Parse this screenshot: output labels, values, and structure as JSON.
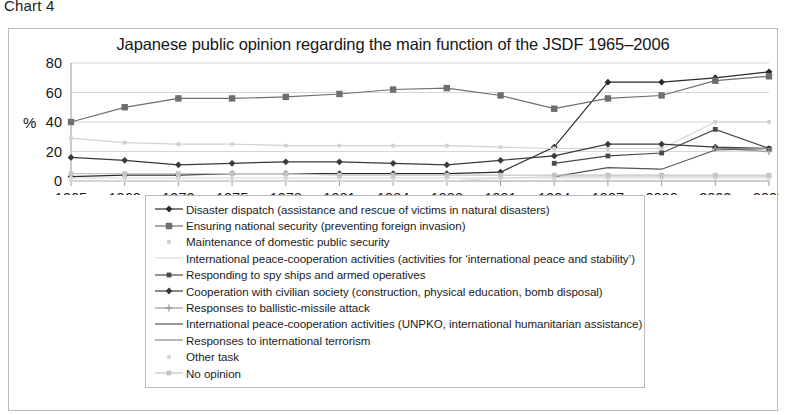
{
  "caption": "Chart 4",
  "chart_data": {
    "type": "line",
    "title": "Japanese public opinion regarding the main function of the JSDF 1965–2006",
    "xlabel": "",
    "ylabel": "%",
    "ylim": [
      0,
      80
    ],
    "yticks": [
      0,
      20,
      40,
      60,
      80
    ],
    "grid": true,
    "legend_position": "below-plot",
    "categories": [
      "1965",
      "1969",
      "1972",
      "1975",
      "1978",
      "1981",
      "1984",
      "1988",
      "1991",
      "1994",
      "1997",
      "2000",
      "2003",
      "2006"
    ],
    "series": [
      {
        "name": "Disaster dispatch (assistance and rescue of victims in natural disasters)",
        "marker": "diamond",
        "color": "#2b2b2b",
        "values": [
          3,
          4,
          4,
          5,
          5,
          5,
          5,
          5,
          6,
          23,
          67,
          67,
          70,
          74
        ]
      },
      {
        "name": "Ensuring national security (preventing foreign invasion)",
        "marker": "square",
        "color": "#6e6e6e",
        "values": [
          40,
          50,
          56,
          56,
          57,
          59,
          62,
          63,
          58,
          49,
          56,
          58,
          68,
          71
        ]
      },
      {
        "name": "Maintenance of domestic public security",
        "marker": "dot-faint",
        "color": "#d2d2d2",
        "values": [
          29,
          26,
          25,
          25,
          24,
          24,
          24,
          24,
          23,
          22,
          22,
          22,
          40,
          40
        ]
      },
      {
        "name": "International peace-cooperation activities (activities for ‘international peace and stability’)",
        "marker": "dash-faint",
        "color": "#dcdcdc",
        "values": [
          0,
          0,
          0,
          0,
          0,
          0,
          0,
          0,
          2,
          3,
          3,
          3,
          3,
          3
        ]
      },
      {
        "name": "Responding to spy ships and armed operatives",
        "marker": "square-small",
        "color": "#4a4a4a",
        "values": [
          null,
          null,
          null,
          null,
          null,
          null,
          null,
          null,
          null,
          12,
          17,
          19,
          35,
          22
        ]
      },
      {
        "name": "Cooperation with civilian society (construction, physical education, bomb disposal)",
        "marker": "diamond",
        "color": "#3a3a3a",
        "values": [
          16,
          14,
          11,
          12,
          13,
          13,
          12,
          11,
          14,
          17,
          25,
          25,
          23,
          22
        ]
      },
      {
        "name": "Responses to ballistic-missile attack",
        "marker": "plus",
        "color": "#9b9b9b",
        "values": [
          null,
          null,
          null,
          null,
          null,
          null,
          null,
          null,
          null,
          null,
          null,
          null,
          22,
          20
        ]
      },
      {
        "name": "International peace-cooperation activities (UNPKO, international humanitarian assistance)",
        "marker": "line",
        "color": "#555555",
        "values": [
          null,
          null,
          null,
          null,
          null,
          null,
          null,
          null,
          null,
          3,
          9,
          8,
          21,
          22
        ]
      },
      {
        "name": "Responses to international terrorism",
        "marker": "dash",
        "color": "#8a8a8a",
        "values": [
          null,
          null,
          null,
          null,
          null,
          null,
          null,
          null,
          null,
          null,
          null,
          null,
          22,
          22
        ]
      },
      {
        "name": "Other task",
        "marker": "dot-faint",
        "color": "#d8d8d8",
        "values": [
          2,
          2,
          2,
          2,
          2,
          2,
          2,
          2,
          2,
          2,
          2,
          2,
          2,
          2
        ]
      },
      {
        "name": "No opinion",
        "marker": "square-small-faint",
        "color": "#c4c4c4",
        "values": [
          5,
          5,
          5,
          5,
          5,
          4,
          4,
          4,
          4,
          4,
          4,
          4,
          4,
          4
        ]
      }
    ]
  }
}
